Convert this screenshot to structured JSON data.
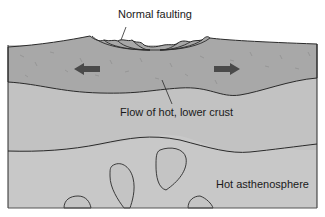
{
  "diagram": {
    "labels": {
      "normal_faulting": "Normal faulting",
      "flow_lower_crust": "Flow of hot, lower crust",
      "hot_asthenosphere": "Hot asthenosphere"
    },
    "layers": [
      {
        "name": "upper-crust",
        "color": "#a9a9a9"
      },
      {
        "name": "lower-crust",
        "color": "#c4c4c4"
      },
      {
        "name": "asthenosphere",
        "color": "#c9c9c9"
      }
    ],
    "arrows": [
      {
        "direction": "left",
        "color": "#4a4a4a"
      },
      {
        "direction": "right",
        "color": "#4a4a4a"
      }
    ],
    "line_color": "#2a2a2a"
  }
}
